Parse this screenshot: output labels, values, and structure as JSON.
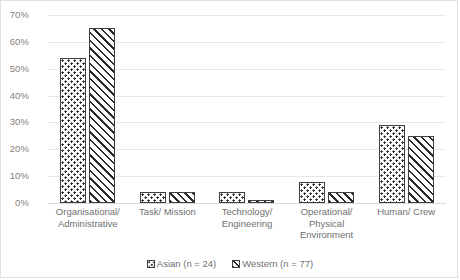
{
  "chart_data": {
    "type": "bar",
    "title": "",
    "subtitle": "",
    "xlabel": "",
    "ylabel": "",
    "ylim": [
      0,
      70
    ],
    "ytick_step": 10,
    "ytick_labels": [
      "70%",
      "60%",
      "50%",
      "40%",
      "30%",
      "20%",
      "10%",
      "0%"
    ],
    "ytick_values": [
      70,
      60,
      50,
      40,
      30,
      20,
      10,
      0
    ],
    "grid": true,
    "value_suffix": "%",
    "legend_position": "bottom-center",
    "categories": [
      "Organisational/ Administrative",
      "Task/ Mission",
      "Technology/ Engineering",
      "Operational/ Physical Environment",
      "Human/ Crew"
    ],
    "series": [
      {
        "name": "Asian (n = 24)",
        "pattern": "dotted",
        "values": [
          54,
          4,
          4,
          8,
          29
        ]
      },
      {
        "name": "Western (n = 77)",
        "pattern": "diagonal-hatch",
        "values": [
          65,
          4,
          1,
          4,
          25
        ]
      }
    ],
    "colors": {
      "bar_outline": "#3f3f3f",
      "bar_fill": "#ffffff",
      "pattern_ink": "#2b2b2b",
      "gridline": "#e8e8e8",
      "baseline": "#d9d9d9",
      "tick_text": "#7f7f7f",
      "label_text": "#6f6f6f",
      "frame_border": "#e0e0e0",
      "background": "#ffffff"
    }
  }
}
